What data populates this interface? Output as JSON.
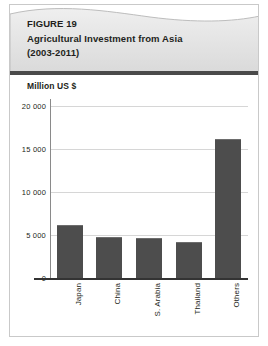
{
  "figure": {
    "label": "FIGURE 19",
    "title": "Agricultural Investment from Asia",
    "period": "(2003-2011)",
    "unit_label": "Million US $"
  },
  "colors": {
    "bar": "#4d4d4d",
    "header_bg": "#e3e3e3",
    "rule": "#4a4a4a",
    "grid": "#d6d6d6",
    "text": "#231f20",
    "frame": "#c9c9c9"
  },
  "chart_data": {
    "type": "bar",
    "title": "Agricultural Investment from Asia (2003-2011)",
    "xlabel": "",
    "ylabel": "Million US $",
    "categories": [
      "Japan",
      "China",
      "S. Arabia",
      "Thailand",
      "Others"
    ],
    "values": [
      6200,
      4800,
      4700,
      4200,
      16100
    ],
    "ylim": [
      0,
      21500
    ],
    "yticks": [
      0,
      5000,
      10000,
      15000,
      20000
    ],
    "ytick_labels": [
      "0",
      "5 000",
      "10 000",
      "15 000",
      "20 000"
    ],
    "grid": true,
    "legend": false,
    "series_color": "#4d4d4d",
    "tick_label_rotation": -90
  }
}
